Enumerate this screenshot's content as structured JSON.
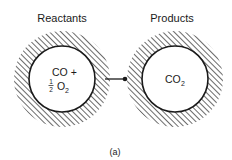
{
  "diagram": {
    "reactants": {
      "heading": "Reactants",
      "line1": "CO +",
      "fraction_num": "1",
      "fraction_den": "2",
      "species": "O",
      "subscript": "2"
    },
    "products": {
      "heading": "Products",
      "species": "CO",
      "subscript": "2"
    },
    "caption": "(a)",
    "colors": {
      "ink": "#1a1a1a",
      "background": "#ffffff"
    }
  }
}
